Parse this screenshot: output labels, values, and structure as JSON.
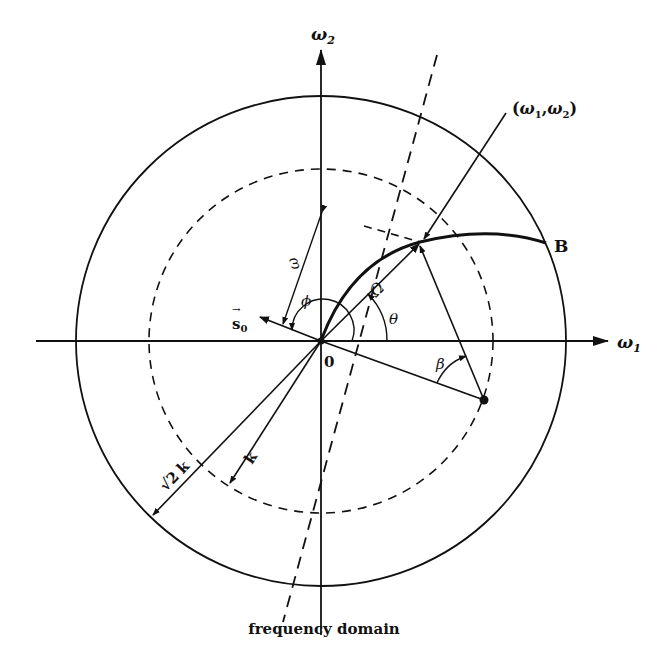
{
  "diagram": {
    "caption": "frequency domain",
    "axes": {
      "x_label": "ω",
      "x_sub": "1",
      "y_label": "ω",
      "y_sub": "2"
    },
    "origin_label": "0",
    "point_label": "(ω1,ω2)",
    "point_label_parts": {
      "open": "(",
      "w": "ω",
      "s1": "1",
      "comma": ",",
      "s2": "2",
      "close": ")"
    },
    "curve_end_label": "B",
    "vector_label": "s",
    "vector_sub": "0",
    "vector_arrow": "→",
    "angle_labels": {
      "phi": "ϕ",
      "theta": "θ",
      "beta": "β"
    },
    "length_labels": {
      "omega": "ω",
      "Omega": "Ω",
      "k": "k",
      "sqrt2k_root": "√",
      "sqrt2k_two": "2",
      "sqrt2k_k": "k"
    },
    "circles": [
      {
        "name": "outer",
        "radius_label": "√2 k",
        "style": "solid"
      },
      {
        "name": "inner",
        "radius_label": "k",
        "style": "dashed"
      }
    ],
    "colors": {
      "ink": "#111111",
      "background": "#ffffff"
    }
  }
}
